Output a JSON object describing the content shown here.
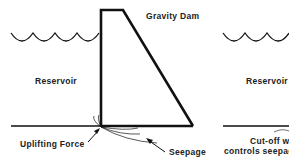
{
  "left_diagram": {
    "title": "Gravity Dam",
    "reservoir_label": "Reservoir",
    "uplift_label": "Uplifting Force",
    "seepage_label": "Seepage"
  },
  "right_diagram": {
    "reservoir_label": "Reservoir",
    "cutoff_line1": "Cut-off w",
    "cutoff_line2": "controls seepage"
  },
  "colors": {
    "line": "#111111",
    "text": "#222222",
    "background": "#ffffff"
  }
}
